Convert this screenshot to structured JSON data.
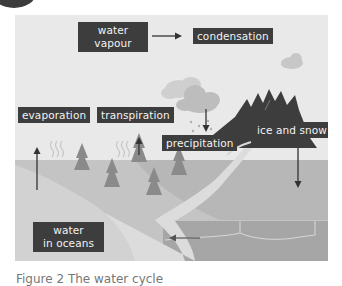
{
  "figure": {
    "caption": "Figure 2 The water cycle",
    "colors": {
      "sky": "#e9e9e9",
      "land": "#c4c4c4",
      "river": "#dcdcdc",
      "ocean": "#a9a9a9",
      "mountain": "#3d3d3d",
      "label_bg": "#3d3d3d",
      "label_text": "#f2f2f2",
      "tree": "#8c8c8c",
      "cloud": "#bdbdbd",
      "arrow": "#333333"
    },
    "labels": {
      "water_vapour": "water\nvapour",
      "water_vapour_line1": "water",
      "water_vapour_line2": "vapour",
      "condensation": "condensation",
      "evaporation": "evaporation",
      "transpiration": "transpiration",
      "precipitation": "precipitation",
      "ice_and_snow": "ice and snow",
      "water_in_oceans_line1": "water",
      "water_in_oceans_line2": "in oceans"
    },
    "arrows": [
      {
        "from": "water vapour",
        "to": "condensation",
        "direction": "right"
      },
      {
        "from": "ground",
        "to": "evaporation",
        "direction": "up"
      },
      {
        "from": "trees",
        "to": "transpiration",
        "direction": "up"
      },
      {
        "from": "cloud",
        "to": "precipitation",
        "direction": "down"
      },
      {
        "from": "ice and snow",
        "to": "land",
        "direction": "down"
      },
      {
        "from": "river",
        "to": "water in oceans",
        "direction": "left"
      }
    ]
  }
}
